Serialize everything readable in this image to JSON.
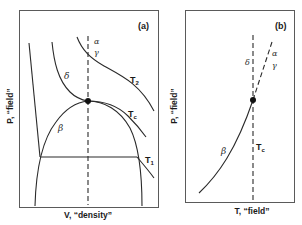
{
  "figure": {
    "panel_a": {
      "tag": "(a)",
      "x_axis_label": "V, “density”",
      "y_axis_label": "P, “field”",
      "isotherm_labels": {
        "t2": "T",
        "t2_sub": "2",
        "tc": "T",
        "tc_sub": "c",
        "t1": "T",
        "t1_sub": "1"
      },
      "phase_labels": {
        "alpha": "α",
        "gamma": "γ",
        "delta": "δ",
        "beta": "β"
      }
    },
    "panel_b": {
      "tag": "(b)",
      "x_axis_label": "T, “field”",
      "y_axis_label": "P, “field”",
      "tc_label": "T",
      "tc_sub": "c",
      "phase_labels": {
        "alpha": "α",
        "gamma": "γ",
        "delta": "δ",
        "beta": "β"
      }
    },
    "colors": {
      "line": "#2a2a2a",
      "frame": "#5a5a5a",
      "background": "#ffffff"
    }
  }
}
